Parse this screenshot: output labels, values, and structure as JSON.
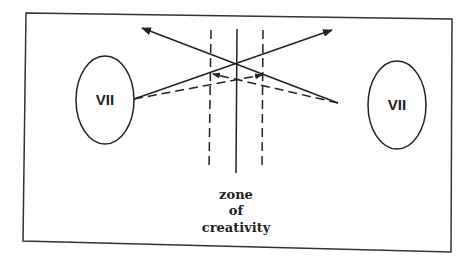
{
  "diagram": {
    "left_node": {
      "label": "VII"
    },
    "right_node": {
      "label": "VII"
    },
    "caption": {
      "line1": "zone",
      "line2": "of",
      "line3": "creativity"
    }
  }
}
